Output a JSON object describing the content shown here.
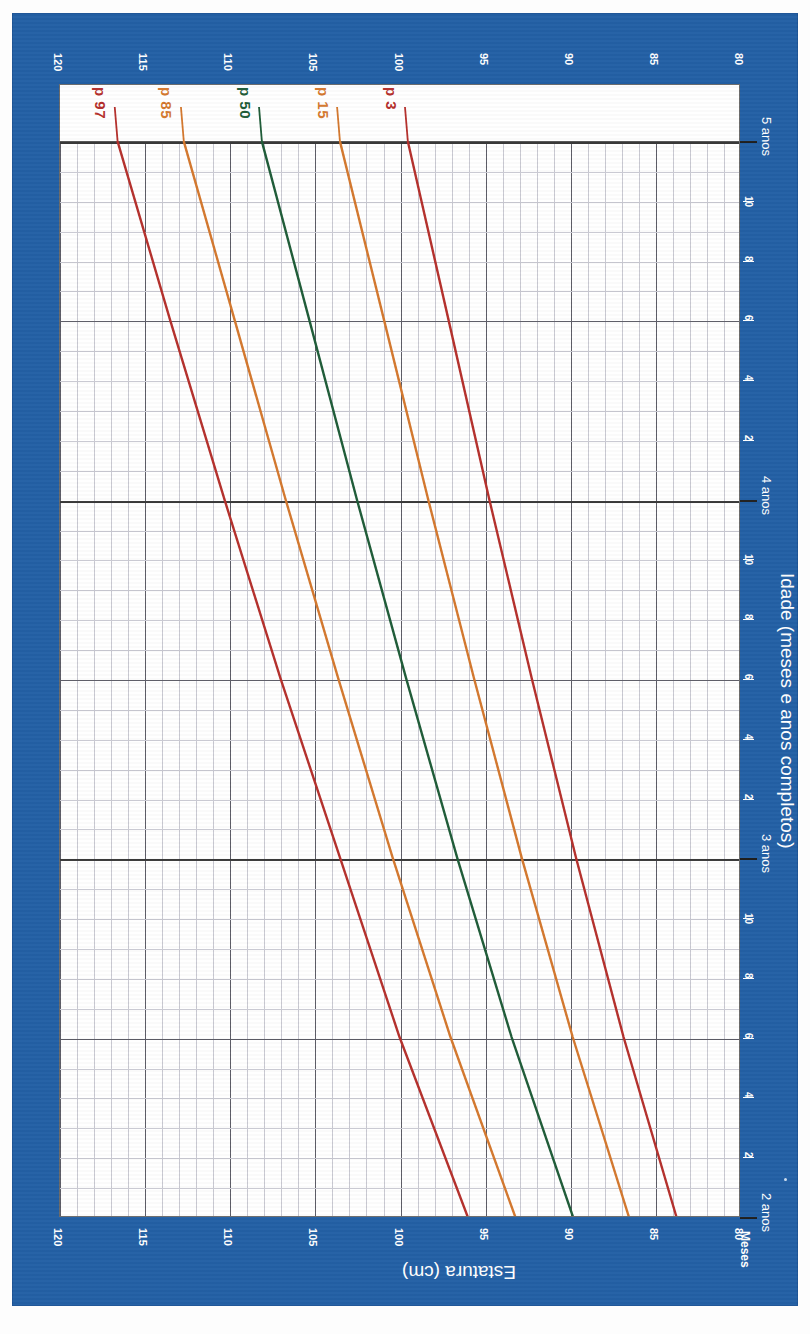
{
  "card": {
    "background_color": "#2360a5"
  },
  "axes": {
    "y_title": "Estatura (cm)",
    "x_title": "Idade (meses e anos completos)",
    "months_label": "Meses",
    "y_ticks": [
      "120",
      "115",
      "110",
      "105",
      "100",
      "95",
      "90",
      "85",
      "80"
    ],
    "y_values": [
      120,
      115,
      110,
      105,
      100,
      95,
      90,
      85,
      80
    ],
    "y_range": [
      80,
      120
    ],
    "x_year_labels": [
      "2 anos",
      "3 anos",
      "4 anos",
      "5 anos"
    ],
    "x_month_ticks": [
      "2",
      "4",
      "6",
      "8",
      "10"
    ],
    "x_range_months": [
      24,
      60
    ]
  },
  "percentile_labels": [
    {
      "text": "p 97",
      "color": "#b5302c"
    },
    {
      "text": "p 85",
      "color": "#d4782e"
    },
    {
      "text": "p 50",
      "color": "#1f5c38"
    },
    {
      "text": "p 15",
      "color": "#d4782e"
    },
    {
      "text": "p 3",
      "color": "#b5302c"
    }
  ],
  "chart_data": {
    "type": "line",
    "xlabel": "Idade (meses e anos completos)",
    "ylabel": "Estatura (cm)",
    "xlim": [
      24,
      60
    ],
    "ylim": [
      80,
      120
    ],
    "grid": true,
    "legend": "inline-end-labels",
    "x_unit": "months",
    "x": [
      24,
      30,
      36,
      42,
      48,
      54,
      60
    ],
    "series": [
      {
        "name": "p 97",
        "color": "#b5302c",
        "values": [
          96.0,
          100.0,
          103.5,
          107.0,
          110.3,
          113.5,
          116.6
        ]
      },
      {
        "name": "p 85",
        "color": "#d4782e",
        "values": [
          93.2,
          97.0,
          100.4,
          103.6,
          106.7,
          109.7,
          112.7
        ]
      },
      {
        "name": "p 50",
        "color": "#1f5c38",
        "values": [
          89.8,
          93.4,
          96.6,
          99.6,
          102.5,
          105.3,
          108.1
        ]
      },
      {
        "name": "p 15",
        "color": "#d4782e",
        "values": [
          86.5,
          89.8,
          92.8,
          95.6,
          98.3,
          100.9,
          103.5
        ]
      },
      {
        "name": "p 3",
        "color": "#b5302c",
        "values": [
          83.7,
          86.8,
          89.6,
          92.2,
          94.7,
          97.1,
          99.5
        ]
      }
    ]
  }
}
